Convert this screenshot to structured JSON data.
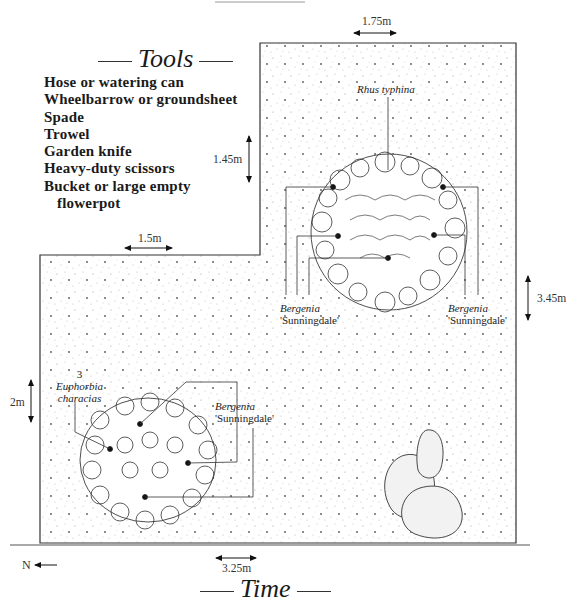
{
  "tools": {
    "title": "Tools",
    "items": [
      "Hose or watering can",
      "Wheelbarrow or groundsheet",
      "Spade",
      "Trowel",
      "Garden knife",
      "Heavy-duty scissors",
      "Bucket or large empty",
      "flowerpot"
    ]
  },
  "dimensions": {
    "top_width": "1.75m",
    "upper_height": "1.45m",
    "step_width": "1.5m",
    "right_height": "3.45m",
    "left_height": "2m",
    "bottom_width": "3.25m"
  },
  "plants": {
    "rhus": "Rhus typhina",
    "bergenia_name": "Bergenia",
    "bergenia_cultivar": "'Sunningdale'",
    "euphorbia_count": "3",
    "euphorbia_name": "Euphorbia",
    "euphorbia_species": "characias"
  },
  "compass": {
    "label": "N"
  },
  "time": {
    "title": "Time"
  }
}
